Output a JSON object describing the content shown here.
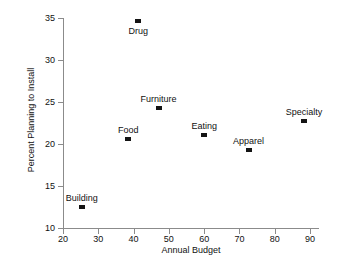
{
  "chart_data": {
    "type": "scatter",
    "title": "",
    "xlabel": "Annual Budget",
    "ylabel": "Percent Planning to Install",
    "xlim": [
      20,
      90
    ],
    "ylim": [
      10,
      35
    ],
    "xticks": [
      20,
      30,
      40,
      50,
      60,
      70,
      80,
      90
    ],
    "yticks": [
      10,
      15,
      20,
      25,
      30,
      35
    ],
    "xticklabels": [
      "20",
      "30",
      "40",
      "50",
      "60",
      "70",
      "80",
      "90"
    ],
    "yticklabels": [
      "10",
      "15",
      "20",
      "25",
      "30",
      "35"
    ],
    "grid": false,
    "legend": null,
    "marker_color": "#141414",
    "axis_color": "#8b8b8b",
    "background": "#ffffff",
    "points": [
      {
        "label": "Building",
        "x": 25.3,
        "y": 12.5,
        "label_pos": "above"
      },
      {
        "label": "Food",
        "x": 38.5,
        "y": 20.6,
        "label_pos": "above"
      },
      {
        "label": "Drug",
        "x": 41.3,
        "y": 34.7,
        "label_pos": "below"
      },
      {
        "label": "Furniture",
        "x": 47.1,
        "y": 24.3,
        "label_pos": "above"
      },
      {
        "label": "Eating",
        "x": 60.0,
        "y": 21.1,
        "label_pos": "above"
      },
      {
        "label": "Apparel",
        "x": 72.6,
        "y": 19.3,
        "label_pos": "above"
      },
      {
        "label": "Specialty",
        "x": 88.3,
        "y": 22.7,
        "label_pos": "above"
      }
    ]
  }
}
